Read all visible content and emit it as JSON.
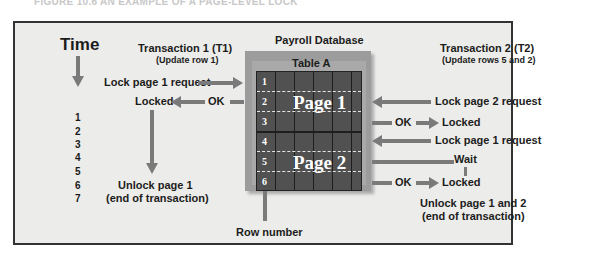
{
  "caption": "FIGURE 10.6  AN EXAMPLE OF A PAGE-LEVEL LOCK",
  "time": {
    "title": "Time",
    "ticks": [
      "1",
      "2",
      "3",
      "4",
      "5",
      "6",
      "7"
    ]
  },
  "database": {
    "title": "Payroll Database",
    "table_title": "Table A",
    "rows": [
      "1",
      "2",
      "3",
      "4",
      "5",
      "6"
    ],
    "pages": [
      "Page 1",
      "Page 2"
    ],
    "row_number_label": "Row number"
  },
  "transaction1": {
    "title": "Transaction 1 (T1)",
    "subtitle": "(Update row 1)",
    "steps": {
      "request": "Lock page 1 request",
      "ok": "OK",
      "locked": "Locked",
      "unlock": "Unlock page 1",
      "unlock_note": "(end of transaction)"
    }
  },
  "transaction2": {
    "title": "Transaction 2 (T2)",
    "subtitle": "(Update rows 5 and 2)",
    "steps": {
      "request_page2": "Lock page 2 request",
      "ok1": "OK",
      "locked1": "Locked",
      "request_page1": "Lock page 1 request",
      "wait": "Wait",
      "ok2": "OK",
      "locked2": "Locked",
      "unlock": "Unlock page 1 and 2",
      "unlock_note": "(end of transaction)"
    }
  },
  "colors": {
    "panel_bg": "#ececea",
    "arrow": "#7a7a7a",
    "grid": "#515151",
    "db_frame": "#9c9c9c"
  }
}
